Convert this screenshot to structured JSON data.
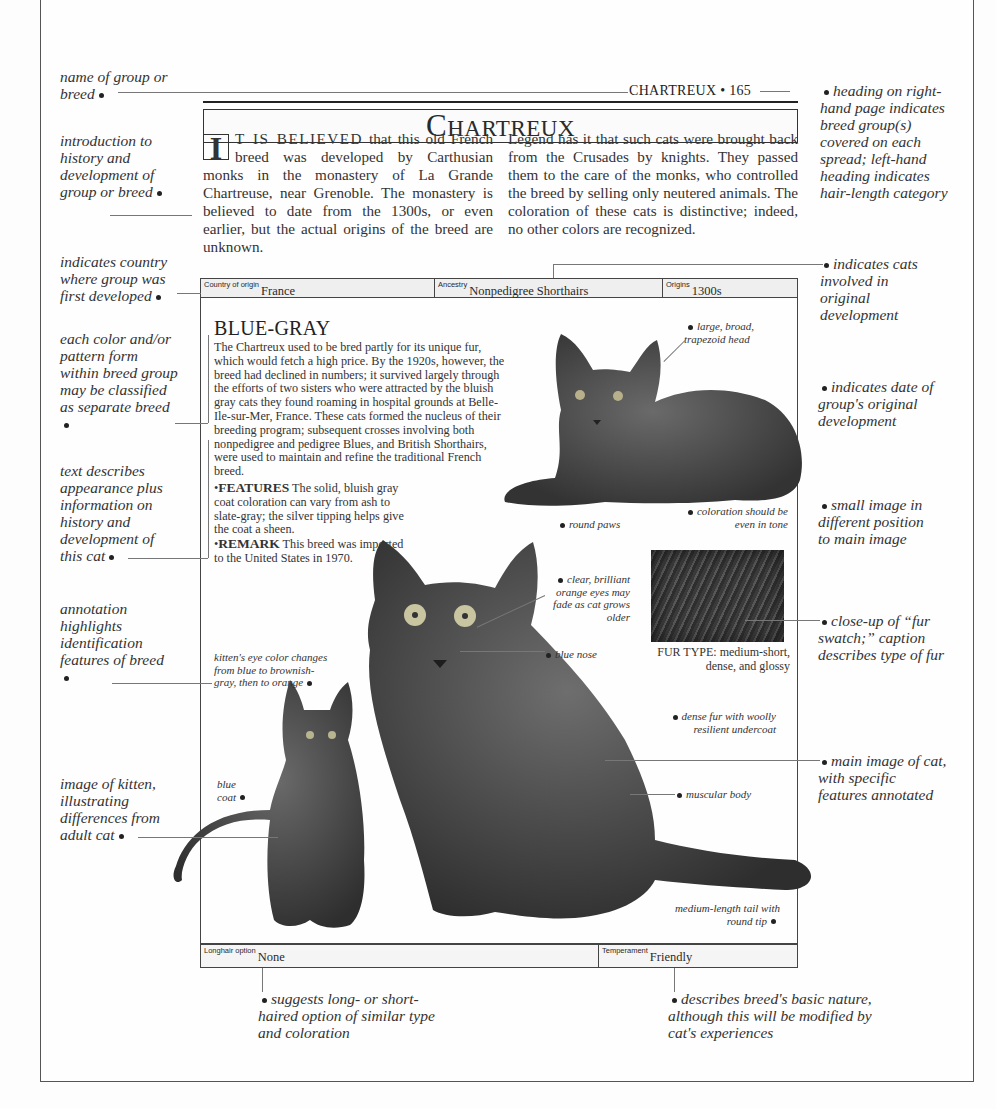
{
  "page": {
    "running_head": "CHARTREUX • 165",
    "title_first": "C",
    "title_rest": "HARTREUX"
  },
  "intro": {
    "dropcap": "I",
    "col1_lead": "T IS BELIEVED",
    "col1_text": " that this old French breed was developed by Carthusian monks in the monastery of La Grande Chartreuse, near Grenoble. The monastery is believed to date from the 1300s, or even earlier, but the actual origins of the breed are unknown.",
    "col2_text": "Legend has it that such cats were brought back from the Crusades by knights. They passed them to the care of the monks, who controlled the breed by selling only neutered animals. The coloration of these cats is distinctive; indeed, no other colors are recognized."
  },
  "infobar": {
    "country_label": "Country of origin",
    "country_value": "France",
    "ancestry_label": "Ancestry",
    "ancestry_value": "Nonpedigree Shorthairs",
    "origins_label": "Origins",
    "origins_value": "1300s"
  },
  "breed": {
    "heading": "BLUE-GRAY",
    "description": "The Chartreux used to be bred partly for its unique fur, which would fetch a high price. By the 1920s, however, the breed had declined in numbers; it survived largely through the efforts of two sisters who were attracted by the bluish gray cats they found roaming in hospital grounds at Belle-Ile-sur-Mer, France. These cats formed the nucleus of their breeding program; subsequent crosses involving both nonpedigree and pedigree Blues, and British Shorthairs, were used to maintain and refine the traditional French breed.",
    "features_label": "FEATURES",
    "features_text": " The solid, bluish gray coat coloration can vary from ash to slate-gray; the silver tipping helps give the coat a sheen.",
    "remark_label": "REMARK",
    "remark_text": " This breed was imported to the United States in 1970.",
    "fur_type_label": "FUR TYPE:",
    "fur_type_text": " medium-short, dense, and glossy"
  },
  "bottombar": {
    "longhair_label": "Longhair option",
    "longhair_value": "None",
    "temperament_label": "Temperament",
    "temperament_value": "Friendly"
  },
  "image_annotations": {
    "head": "large, broad, trapezoid head",
    "paws": "round paws",
    "coloration": "coloration should be even in tone",
    "eyes": "clear, brilliant orange eyes may fade as cat grows older",
    "nose": "blue nose",
    "kitten_eyes": "kitten's eye color changes from blue to brownish-gray, then to orange",
    "fur": "dense fur with woolly resilient undercoat",
    "body": "muscular body",
    "coat": "blue coat",
    "tail": "medium-length tail with round tip"
  },
  "margin_notes": {
    "left": [
      "name of group or breed",
      "introduction to history and development of group or breed",
      "indicates country where group was first developed",
      "each color and/or pattern form within breed group may be classified as separate breed",
      "text describes appearance plus information on history and development of this cat",
      "annotation highlights identification features of breed",
      "image of kitten, illustrating differences from adult cat"
    ],
    "right": [
      "heading on right-hand page indicates breed group(s) covered on each spread; left-hand heading indicates hair-length category",
      "indicates cats involved in original development",
      "indicates date of group's original development",
      "small image in different position to main image",
      "close-up of “fur swatch;” caption describes type of fur",
      "main image of cat, with specific features annotated"
    ],
    "bottom": [
      "suggests long- or short-haired option of similar type and coloration",
      "describes breed's basic nature, although this will be modified by cat's experiences"
    ]
  }
}
